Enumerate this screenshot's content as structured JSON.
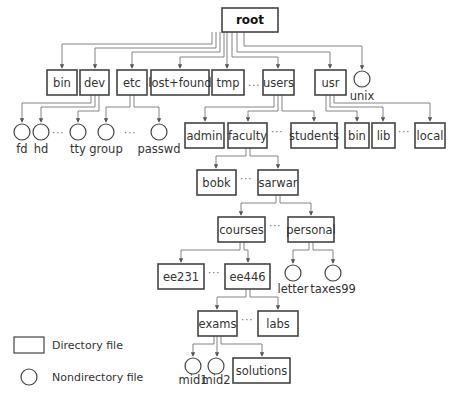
{
  "diagram": {
    "type": "tree",
    "colors": {
      "stroke": "#444444",
      "edge": "#777777",
      "text": "#333333",
      "background": "#ffffff"
    },
    "nodes": [
      {
        "id": "root",
        "label": "root",
        "kind": "directory",
        "x": 222,
        "y": 8,
        "w": 56,
        "h": 24,
        "bold": true
      },
      {
        "id": "bin",
        "label": "bin",
        "kind": "directory",
        "x": 47,
        "y": 70,
        "w": 30,
        "h": 25
      },
      {
        "id": "dev",
        "label": "dev",
        "kind": "directory",
        "x": 80,
        "y": 70,
        "w": 29,
        "h": 25
      },
      {
        "id": "etc",
        "label": "etc",
        "kind": "directory",
        "x": 117,
        "y": 70,
        "w": 30,
        "h": 25
      },
      {
        "id": "lost_found",
        "label": "lost+found",
        "kind": "directory",
        "x": 151,
        "y": 70,
        "w": 58,
        "h": 25
      },
      {
        "id": "tmp",
        "label": "tmp",
        "kind": "directory",
        "x": 212,
        "y": 70,
        "w": 32,
        "h": 25
      },
      {
        "id": "users",
        "label": "users",
        "kind": "directory",
        "x": 263,
        "y": 70,
        "w": 31,
        "h": 25
      },
      {
        "id": "usr",
        "label": "usr",
        "kind": "directory",
        "x": 315,
        "y": 70,
        "w": 31,
        "h": 25
      },
      {
        "id": "unix",
        "label": "unix",
        "kind": "file",
        "cx": 362,
        "cy": 79,
        "r": 8,
        "label_dy": 21
      },
      {
        "id": "fd",
        "label": "fd",
        "kind": "file",
        "cx": 22,
        "cy": 132,
        "r": 8,
        "label_dy": 21
      },
      {
        "id": "hd",
        "label": "hd",
        "kind": "file",
        "cx": 41,
        "cy": 132,
        "r": 8,
        "label_dy": 21
      },
      {
        "id": "tty",
        "label": "tty",
        "kind": "file",
        "cx": 78,
        "cy": 132,
        "r": 8,
        "label_dy": 21
      },
      {
        "id": "group",
        "label": "group",
        "kind": "file",
        "cx": 106,
        "cy": 132,
        "r": 8,
        "label_dy": 21
      },
      {
        "id": "passwd",
        "label": "passwd",
        "kind": "file",
        "cx": 159,
        "cy": 132,
        "r": 8,
        "label_dy": 21
      },
      {
        "id": "admin",
        "label": "admin",
        "kind": "directory",
        "x": 185,
        "y": 123,
        "w": 39,
        "h": 25
      },
      {
        "id": "faculty",
        "label": "faculty",
        "kind": "directory",
        "x": 228,
        "y": 123,
        "w": 39,
        "h": 25
      },
      {
        "id": "students",
        "label": "students",
        "kind": "directory",
        "x": 291,
        "y": 123,
        "w": 46,
        "h": 25
      },
      {
        "id": "usr_bin",
        "label": "bin",
        "kind": "directory",
        "x": 345,
        "y": 123,
        "w": 24,
        "h": 25
      },
      {
        "id": "lib",
        "label": "lib",
        "kind": "directory",
        "x": 372,
        "y": 123,
        "w": 23,
        "h": 25
      },
      {
        "id": "local",
        "label": "local",
        "kind": "directory",
        "x": 415,
        "y": 123,
        "w": 30,
        "h": 25
      },
      {
        "id": "bobk",
        "label": "bobk",
        "kind": "directory",
        "x": 197,
        "y": 170,
        "w": 39,
        "h": 25
      },
      {
        "id": "sarwar",
        "label": "sarwar",
        "kind": "directory",
        "x": 258,
        "y": 170,
        "w": 40,
        "h": 25
      },
      {
        "id": "courses",
        "label": "courses",
        "kind": "directory",
        "x": 218,
        "y": 217,
        "w": 47,
        "h": 25
      },
      {
        "id": "personal",
        "label": "personal",
        "kind": "directory",
        "x": 288,
        "y": 217,
        "w": 46,
        "h": 25
      },
      {
        "id": "ee231",
        "label": "ee231",
        "kind": "directory",
        "x": 158,
        "y": 264,
        "w": 46,
        "h": 25
      },
      {
        "id": "ee446",
        "label": "ee446",
        "kind": "directory",
        "x": 225,
        "y": 264,
        "w": 45,
        "h": 25
      },
      {
        "id": "letter",
        "label": "letter",
        "kind": "file",
        "cx": 293,
        "cy": 273,
        "r": 8,
        "label_dy": 20
      },
      {
        "id": "taxes99",
        "label": "taxes99",
        "kind": "file",
        "cx": 333,
        "cy": 273,
        "r": 8,
        "label_dy": 20
      },
      {
        "id": "exams",
        "label": "exams",
        "kind": "directory",
        "x": 198,
        "y": 311,
        "w": 39,
        "h": 25
      },
      {
        "id": "labs",
        "label": "labs",
        "kind": "directory",
        "x": 258,
        "y": 311,
        "w": 40,
        "h": 25
      },
      {
        "id": "mid1",
        "label": "mid1",
        "kind": "file",
        "cx": 193,
        "cy": 366,
        "r": 8,
        "label_dy": 18
      },
      {
        "id": "mid2",
        "label": "mid2",
        "kind": "file",
        "cx": 216,
        "cy": 366,
        "r": 8,
        "label_dy": 18
      },
      {
        "id": "solutions",
        "label": "solutions",
        "kind": "directory",
        "x": 233,
        "y": 358,
        "w": 57,
        "h": 25
      }
    ],
    "edges": [
      {
        "from": "root",
        "to": "bin",
        "points": [
          [
            212,
            32
          ],
          [
            212,
            44
          ],
          [
            62,
            44
          ],
          [
            62,
            68
          ]
        ]
      },
      {
        "from": "root",
        "to": "dev",
        "points": [
          [
            216,
            32
          ],
          [
            216,
            48
          ],
          [
            95,
            48
          ],
          [
            95,
            68
          ]
        ]
      },
      {
        "from": "root",
        "to": "etc",
        "points": [
          [
            220,
            32
          ],
          [
            220,
            52
          ],
          [
            132,
            52
          ],
          [
            132,
            68
          ]
        ]
      },
      {
        "from": "root",
        "to": "lost_found",
        "points": [
          [
            224,
            32
          ],
          [
            224,
            57
          ],
          [
            180,
            57
          ],
          [
            180,
            68
          ]
        ]
      },
      {
        "from": "root",
        "to": "tmp",
        "points": [
          [
            227,
            32
          ],
          [
            227,
            68
          ]
        ]
      },
      {
        "from": "root",
        "to": "users",
        "points": [
          [
            232,
            32
          ],
          [
            232,
            57
          ],
          [
            278,
            57
          ],
          [
            278,
            68
          ]
        ]
      },
      {
        "from": "root",
        "to": "usr",
        "points": [
          [
            237,
            32
          ],
          [
            237,
            52
          ],
          [
            330,
            52
          ],
          [
            330,
            68
          ]
        ]
      },
      {
        "from": "root",
        "to": "unix",
        "points": [
          [
            244,
            32
          ],
          [
            244,
            46
          ],
          [
            362,
            46
          ],
          [
            362,
            69
          ]
        ]
      },
      {
        "from": "dev",
        "to": "fd",
        "points": [
          [
            91,
            95
          ],
          [
            91,
            103
          ],
          [
            22,
            103
          ],
          [
            22,
            122
          ]
        ]
      },
      {
        "from": "dev",
        "to": "hd",
        "points": [
          [
            95,
            95
          ],
          [
            95,
            107
          ],
          [
            41,
            107
          ],
          [
            41,
            122
          ]
        ]
      },
      {
        "from": "dev",
        "to": "tty",
        "points": [
          [
            99,
            95
          ],
          [
            99,
            111
          ],
          [
            78,
            111
          ],
          [
            78,
            122
          ]
        ]
      },
      {
        "from": "etc",
        "to": "group",
        "points": [
          [
            130,
            95
          ],
          [
            130,
            107
          ],
          [
            106,
            107
          ],
          [
            106,
            122
          ]
        ]
      },
      {
        "from": "etc",
        "to": "passwd",
        "points": [
          [
            134,
            95
          ],
          [
            134,
            107
          ],
          [
            159,
            107
          ],
          [
            159,
            122
          ]
        ]
      },
      {
        "from": "users",
        "to": "admin",
        "points": [
          [
            274,
            95
          ],
          [
            274,
            107
          ],
          [
            205,
            107
          ],
          [
            205,
            121
          ]
        ]
      },
      {
        "from": "users",
        "to": "faculty",
        "points": [
          [
            278,
            95
          ],
          [
            278,
            111
          ],
          [
            248,
            111
          ],
          [
            248,
            121
          ]
        ]
      },
      {
        "from": "users",
        "to": "students",
        "points": [
          [
            282,
            95
          ],
          [
            282,
            111
          ],
          [
            314,
            111
          ],
          [
            314,
            121
          ]
        ]
      },
      {
        "from": "usr",
        "to": "usr_bin",
        "points": [
          [
            326,
            95
          ],
          [
            326,
            111
          ],
          [
            357,
            111
          ],
          [
            357,
            121
          ]
        ]
      },
      {
        "from": "usr",
        "to": "lib",
        "points": [
          [
            330,
            95
          ],
          [
            330,
            107
          ],
          [
            383,
            107
          ],
          [
            383,
            121
          ]
        ]
      },
      {
        "from": "usr",
        "to": "local",
        "points": [
          [
            334,
            95
          ],
          [
            334,
            103
          ],
          [
            430,
            103
          ],
          [
            430,
            121
          ]
        ]
      },
      {
        "from": "faculty",
        "to": "bobk",
        "points": [
          [
            246,
            148
          ],
          [
            246,
            156
          ],
          [
            216,
            156
          ],
          [
            216,
            168
          ]
        ]
      },
      {
        "from": "faculty",
        "to": "sarwar",
        "points": [
          [
            250,
            148
          ],
          [
            250,
            156
          ],
          [
            278,
            156
          ],
          [
            278,
            168
          ]
        ]
      },
      {
        "from": "sarwar",
        "to": "courses",
        "points": [
          [
            276,
            195
          ],
          [
            276,
            203
          ],
          [
            241,
            203
          ],
          [
            241,
            215
          ]
        ]
      },
      {
        "from": "sarwar",
        "to": "personal",
        "points": [
          [
            280,
            195
          ],
          [
            280,
            203
          ],
          [
            311,
            203
          ],
          [
            311,
            215
          ]
        ]
      },
      {
        "from": "courses",
        "to": "ee231",
        "points": [
          [
            240,
            242
          ],
          [
            240,
            250
          ],
          [
            181,
            250
          ],
          [
            181,
            262
          ]
        ]
      },
      {
        "from": "courses",
        "to": "ee446",
        "points": [
          [
            244,
            242
          ],
          [
            244,
            250
          ],
          [
            248,
            250
          ],
          [
            248,
            262
          ]
        ]
      },
      {
        "from": "personal",
        "to": "letter",
        "points": [
          [
            309,
            242
          ],
          [
            309,
            250
          ],
          [
            293,
            250
          ],
          [
            293,
            263
          ]
        ]
      },
      {
        "from": "personal",
        "to": "taxes99",
        "points": [
          [
            313,
            242
          ],
          [
            313,
            250
          ],
          [
            333,
            250
          ],
          [
            333,
            263
          ]
        ]
      },
      {
        "from": "ee446",
        "to": "exams",
        "points": [
          [
            246,
            289
          ],
          [
            246,
            297
          ],
          [
            217,
            297
          ],
          [
            217,
            309
          ]
        ]
      },
      {
        "from": "ee446",
        "to": "labs",
        "points": [
          [
            250,
            289
          ],
          [
            250,
            297
          ],
          [
            278,
            297
          ],
          [
            278,
            309
          ]
        ]
      },
      {
        "from": "exams",
        "to": "mid1",
        "points": [
          [
            214,
            336
          ],
          [
            214,
            344
          ],
          [
            193,
            344
          ],
          [
            193,
            356
          ]
        ]
      },
      {
        "from": "exams",
        "to": "mid2",
        "points": [
          [
            217,
            336
          ],
          [
            217,
            356
          ]
        ]
      },
      {
        "from": "exams",
        "to": "solutions",
        "points": [
          [
            221,
            336
          ],
          [
            221,
            344
          ],
          [
            262,
            344
          ],
          [
            262,
            356
          ]
        ]
      }
    ],
    "ellipses": [
      {
        "between": [
          "tmp",
          "users"
        ],
        "x": 248,
        "y": 86,
        "text": "..."
      },
      {
        "between": [
          "hd",
          "tty"
        ],
        "x": 52,
        "y": 136,
        "text": "···"
      },
      {
        "between": [
          "group",
          "passwd"
        ],
        "x": 124,
        "y": 136,
        "text": "···"
      },
      {
        "between": [
          "faculty",
          "students"
        ],
        "x": 271,
        "y": 135,
        "text": "···"
      },
      {
        "between": [
          "lib",
          "local"
        ],
        "x": 398,
        "y": 135,
        "text": "···"
      },
      {
        "between": [
          "bobk",
          "sarwar"
        ],
        "x": 240,
        "y": 182,
        "text": "···"
      },
      {
        "between": [
          "courses",
          "personal"
        ],
        "x": 269,
        "y": 229,
        "text": "···"
      },
      {
        "between": [
          "ee231",
          "ee446"
        ],
        "x": 208,
        "y": 276,
        "text": "···"
      },
      {
        "between": [
          "exams",
          "labs"
        ],
        "x": 241,
        "y": 323,
        "text": "···"
      }
    ]
  },
  "legend": {
    "items": [
      {
        "symbol": "rectangle",
        "label": "Directory file"
      },
      {
        "symbol": "circle",
        "label": "Nondirectory file"
      }
    ]
  }
}
